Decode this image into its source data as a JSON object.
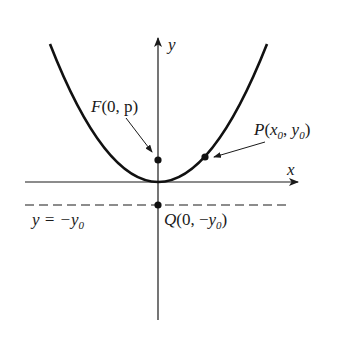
{
  "figure": {
    "type": "parabola-focus-directrix",
    "axes": {
      "x_label": "x",
      "y_label": "y"
    },
    "points": {
      "focus": {
        "name": "F",
        "coords": "(0, p)"
      },
      "point": {
        "name": "P",
        "coords": "(x",
        "sub1": "0",
        "mid": ", y",
        "sub2": "0",
        "end": ")"
      },
      "q": {
        "name": "Q",
        "coords": "(0, −y",
        "sub": "0",
        "end": ")"
      }
    },
    "directrix": {
      "label": "y = −y",
      "sub": "0"
    },
    "colors": {
      "ink": "#1a1a1a",
      "background": "#ffffff"
    }
  }
}
